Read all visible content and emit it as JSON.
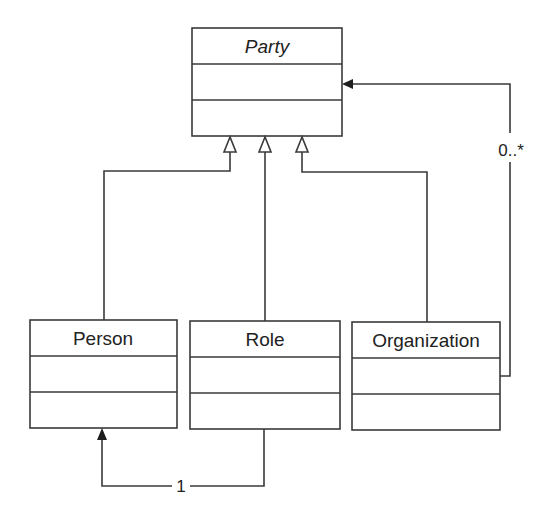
{
  "diagram": {
    "type": "UML class diagram",
    "classes": [
      {
        "id": "party",
        "name": "Party",
        "abstract": true
      },
      {
        "id": "person",
        "name": "Person",
        "abstract": false
      },
      {
        "id": "role",
        "name": "Role",
        "abstract": false
      },
      {
        "id": "organization",
        "name": "Organization",
        "abstract": false
      }
    ],
    "relationships": [
      {
        "type": "generalization",
        "from": "Person",
        "to": "Party"
      },
      {
        "type": "generalization",
        "from": "Role",
        "to": "Party"
      },
      {
        "type": "generalization",
        "from": "Organization",
        "to": "Party"
      },
      {
        "type": "association",
        "from": "Organization",
        "to": "Party",
        "multiplicity": "0..*"
      },
      {
        "type": "association",
        "from": "Role",
        "to": "Person",
        "multiplicity": "1"
      }
    ]
  },
  "labels": {
    "party": "Party",
    "person": "Person",
    "role": "Role",
    "organization": "Organization",
    "mult_org_party": "0..*",
    "mult_role_person": "1"
  }
}
